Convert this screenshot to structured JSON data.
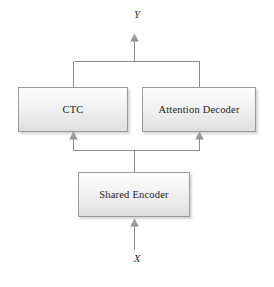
{
  "diagram": {
    "type": "flowchart",
    "canvas": {
      "width": 274,
      "height": 287,
      "background": "#ffffff"
    },
    "style": {
      "box_border_color": "#9a9a9a",
      "box_fill_top": "#fdfdfd",
      "box_fill_bottom": "#dedede",
      "connector_color": "#8c8c8c",
      "arrowhead_color": "#9b9b9b",
      "text_color": "#1c1c1c"
    },
    "nodes": [
      {
        "id": "ctc",
        "label": "CTC"
      },
      {
        "id": "attention_decoder",
        "label": "Attention Decoder"
      },
      {
        "id": "shared_encoder",
        "label": "Shared Encoder"
      }
    ],
    "variables": [
      {
        "id": "output",
        "label": "Y",
        "position": "top"
      },
      {
        "id": "input",
        "label": "X",
        "position": "bottom"
      }
    ],
    "edges": [
      {
        "from": "X",
        "to": "shared_encoder",
        "arrow": true
      },
      {
        "from": "shared_encoder",
        "to": "ctc",
        "arrow": true
      },
      {
        "from": "shared_encoder",
        "to": "attention_decoder",
        "arrow": true
      },
      {
        "from": "ctc",
        "to": "Y",
        "arrow": true
      },
      {
        "from": "attention_decoder",
        "to": "Y",
        "arrow": true
      }
    ]
  }
}
